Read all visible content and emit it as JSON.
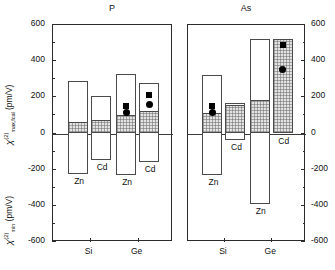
{
  "chart_data": {
    "type": "bar",
    "title": "",
    "ylabel_top": "χ(2)max,fcal (pm/V)",
    "ylabel_bottom": "χ(2)min (pm/V)",
    "xlabel": "",
    "ylim": [
      -600,
      600
    ],
    "yticks_major": [
      600,
      400,
      200,
      0,
      -200,
      -400,
      -600
    ],
    "ytick_labels": [
      "600",
      "400",
      "200",
      "0",
      "-200",
      "-400",
      "-600"
    ],
    "yticks_minor": [
      500,
      300,
      100,
      -100,
      -300,
      -500
    ],
    "grid": false,
    "legend": "none",
    "units": "pm/V",
    "panels": [
      {
        "name": "P",
        "title": "P",
        "categories": [
          "Si",
          "Ge"
        ],
        "groups": [
          {
            "category": "Si",
            "bars": [
              {
                "label": "Zn",
                "range_min": -225,
                "range_max": 288,
                "fill_min": 0,
                "fill_max": 62,
                "markers": []
              },
              {
                "label": "Cd",
                "range_min": -147,
                "range_max": 210,
                "fill_min": 0,
                "fill_max": 72,
                "markers": []
              }
            ]
          },
          {
            "category": "Ge",
            "bars": [
              {
                "label": "Zn",
                "range_min": -232,
                "range_max": 330,
                "fill_min": 0,
                "fill_max": 100,
                "markers": [
                  {
                    "shape": "square",
                    "value": 152
                  },
                  {
                    "shape": "circle",
                    "value": 115
                  }
                ]
              },
              {
                "label": "Cd",
                "range_min": -158,
                "range_max": 282,
                "fill_min": 0,
                "fill_max": 125,
                "markers": [
                  {
                    "shape": "square",
                    "value": 213
                  },
                  {
                    "shape": "circle",
                    "value": 160
                  }
                ]
              }
            ]
          }
        ]
      },
      {
        "name": "As",
        "title": "As",
        "categories": [
          "Si",
          "Ge"
        ],
        "groups": [
          {
            "category": "Si",
            "bars": [
              {
                "label": "Zn",
                "range_min": -228,
                "range_max": 325,
                "fill_min": 0,
                "fill_max": 112,
                "markers": [
                  {
                    "shape": "square",
                    "value": 153
                  },
                  {
                    "shape": "circle",
                    "value": 118
                  }
                ]
              },
              {
                "label": "Cd",
                "range_min": -37,
                "range_max": 170,
                "fill_min": 0,
                "fill_max": 160,
                "markers": []
              }
            ]
          },
          {
            "category": "Ge",
            "bars": [
              {
                "label": "Zn",
                "range_min": -390,
                "range_max": 520,
                "fill_min": 0,
                "fill_max": 185,
                "markers": []
              },
              {
                "label": "Cd",
                "range_min": 0,
                "range_max": 520,
                "fill_min": 0,
                "fill_max": 520,
                "markers": [
                  {
                    "shape": "square",
                    "value": 487
                  },
                  {
                    "shape": "circle",
                    "value": 355
                  }
                ]
              }
            ]
          }
        ]
      }
    ]
  }
}
